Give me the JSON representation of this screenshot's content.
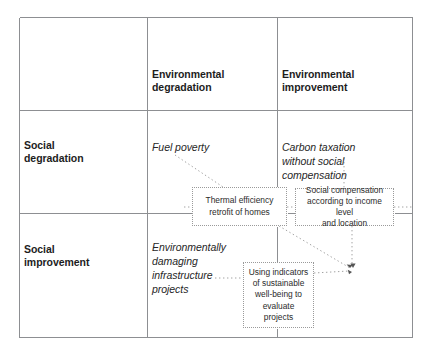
{
  "diagram": {
    "title": "",
    "type": "two-by-two-matrix",
    "colors": {
      "grid_line": "#8d8f92",
      "box_border": "#9a9a9a",
      "connector": "#a0a0a0",
      "text": "#1d1d1d"
    },
    "columns": [
      {
        "id": "col-blank",
        "label": ""
      },
      {
        "id": "col-env-degradation",
        "label": "Environmental\ndegradation",
        "line1": "Environmental",
        "line2": "degradation"
      },
      {
        "id": "col-env-improvement",
        "label": "Environmental\nimprovement",
        "line1": "Environmental",
        "line2": "improvement"
      }
    ],
    "rows": [
      {
        "id": "row-social-degradation",
        "line1": "Social",
        "line2": "degradation"
      },
      {
        "id": "row-social-improvement",
        "line1": "Social",
        "line2": "improvement"
      }
    ],
    "quadrants": [
      {
        "id": "quad-fuel-poverty",
        "row": "social-degradation",
        "column": "environmental-degradation",
        "lines": [
          "Fuel poverty"
        ]
      },
      {
        "id": "quad-carbon-taxation",
        "row": "social-degradation",
        "column": "environmental-improvement",
        "lines": [
          "Carbon taxation",
          "without social compensation"
        ]
      },
      {
        "id": "quad-infrastructure",
        "row": "social-improvement",
        "column": "environmental-degradation",
        "lines": [
          "Environmentally",
          "damaging",
          "infrastructure",
          "projects"
        ]
      },
      {
        "id": "quad-empty",
        "row": "social-improvement",
        "column": "environmental-improvement",
        "lines": []
      }
    ],
    "intervention_boxes": [
      {
        "id": "box-thermal",
        "lines": [
          "Thermal efficiency",
          "retrofit of homes"
        ]
      },
      {
        "id": "box-social-compensation",
        "lines": [
          "Social compensation",
          "according to income level",
          "and location"
        ]
      },
      {
        "id": "box-indicators",
        "lines": [
          "Using indicators",
          "of sustainable",
          "well-being to",
          "evaluate",
          "projects"
        ]
      }
    ],
    "connectors": [
      {
        "from": "quad-fuel-poverty",
        "to": "box-thermal",
        "style": "dotted",
        "arrow": false
      },
      {
        "from": "quad-carbon-taxation",
        "to": "box-social-compensation",
        "style": "dotted",
        "arrow": false
      },
      {
        "from": "quad-infrastructure",
        "to": "box-indicators",
        "style": "dotted",
        "arrow": false
      },
      {
        "from": "box-thermal",
        "to": "target-point",
        "style": "dotted",
        "arrow": true
      },
      {
        "from": "box-social-compensation",
        "to": "target-point",
        "style": "dotted",
        "arrow": true
      },
      {
        "from": "box-indicators",
        "to": "target-point",
        "style": "dotted",
        "arrow": true
      }
    ]
  }
}
